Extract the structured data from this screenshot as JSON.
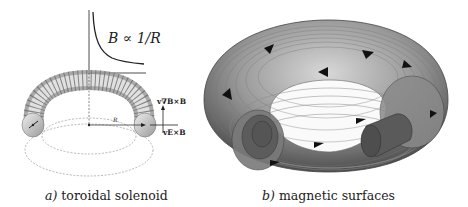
{
  "figure": {
    "panels": [
      {
        "id": "a",
        "caption_letter": "a)",
        "caption_text": "toroidal solenoid",
        "formula": "B ∝ 1/R",
        "radius_label": "R",
        "drift_labels": {
          "grad_b": "v∇B×B",
          "e_cross_b": "vE×B"
        }
      },
      {
        "id": "b",
        "caption_letter": "b)",
        "caption_text": "magnetic surfaces"
      }
    ],
    "colors": {
      "torus_dark": "#5a5a5a",
      "torus_light": "#c8c8c8",
      "line": "#222222",
      "dashed": "#777777"
    }
  }
}
